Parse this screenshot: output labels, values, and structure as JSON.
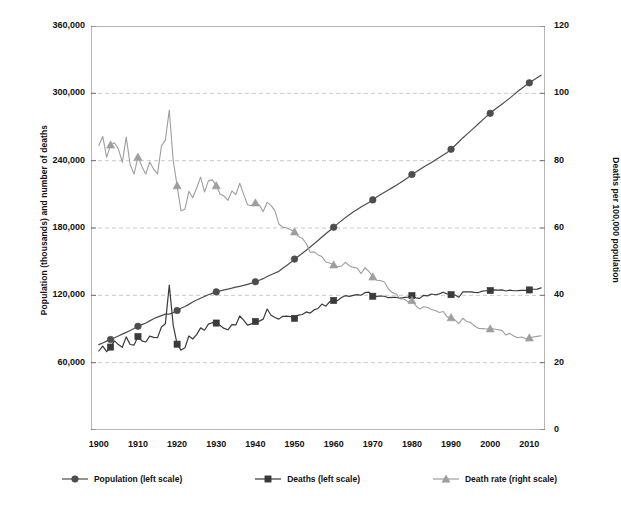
{
  "chart_data": {
    "type": "line",
    "title": "",
    "subtitle": "",
    "xlabel": "",
    "ylabel": "Population (thousands) and number of deaths",
    "y2label": "Deaths per 100,000 population",
    "xlim": [
      1898,
      2014
    ],
    "ylim": [
      0,
      360000
    ],
    "y2lim": [
      0,
      120
    ],
    "grid": true,
    "legend_position": "bottom",
    "x_ticks": [
      1900,
      1910,
      1920,
      1930,
      1940,
      1950,
      1960,
      1970,
      1980,
      1990,
      2000,
      2010
    ],
    "y_ticks": [
      0,
      60000,
      120000,
      180000,
      240000,
      300000,
      360000
    ],
    "y_tick_labels": [
      "",
      "60,000",
      "120,000",
      "180,000",
      "240,000",
      "300,000",
      "360,000"
    ],
    "y2_ticks": [
      0,
      20,
      40,
      60,
      80,
      100,
      120
    ],
    "y2_tick_labels": [
      "0",
      "20",
      "40",
      "60",
      "80",
      "100",
      "120"
    ],
    "marker_years": [
      1903,
      1910,
      1920,
      1930,
      1940,
      1950,
      1960,
      1970,
      1980,
      1990,
      2000,
      2010
    ],
    "series": [
      {
        "name": "Population (left scale)",
        "axis": "left",
        "color": "#4d4d4d",
        "marker": "circle",
        "x": [
          1900,
          1901,
          1902,
          1903,
          1904,
          1905,
          1906,
          1907,
          1908,
          1909,
          1910,
          1911,
          1912,
          1913,
          1914,
          1915,
          1916,
          1917,
          1918,
          1919,
          1920,
          1921,
          1922,
          1923,
          1924,
          1925,
          1926,
          1927,
          1928,
          1929,
          1930,
          1931,
          1932,
          1933,
          1934,
          1935,
          1936,
          1937,
          1938,
          1939,
          1940,
          1941,
          1942,
          1943,
          1944,
          1945,
          1946,
          1947,
          1948,
          1949,
          1950,
          1951,
          1952,
          1953,
          1954,
          1955,
          1956,
          1957,
          1958,
          1959,
          1960,
          1961,
          1962,
          1963,
          1964,
          1965,
          1966,
          1967,
          1968,
          1969,
          1970,
          1971,
          1972,
          1973,
          1974,
          1975,
          1976,
          1977,
          1978,
          1979,
          1980,
          1981,
          1982,
          1983,
          1984,
          1985,
          1986,
          1987,
          1988,
          1989,
          1990,
          1991,
          1992,
          1993,
          1994,
          1995,
          1996,
          1997,
          1998,
          1999,
          2000,
          2001,
          2002,
          2003,
          2004,
          2005,
          2006,
          2007,
          2008,
          2009,
          2010,
          2011,
          2012,
          2013
        ],
        "values": [
          76094,
          77585,
          79160,
          80632,
          82166,
          83822,
          85450,
          87008,
          88710,
          90490,
          92407,
          93863,
          95335,
          97225,
          99111,
          100546,
          101961,
          103268,
          103208,
          104514,
          106461,
          108538,
          110049,
          111947,
          114109,
          115829,
          117397,
          119035,
          120509,
          121767,
          123077,
          124040,
          124840,
          125579,
          126374,
          127250,
          128053,
          128825,
          129825,
          130880,
          132122,
          133402,
          134860,
          136739,
          138397,
          139928,
          141389,
          144126,
          146631,
          149188,
          152271,
          154878,
          157553,
          160184,
          163026,
          165931,
          168903,
          171984,
          174882,
          177830,
          180671,
          183691,
          186538,
          189242,
          191889,
          194303,
          196560,
          198712,
          200706,
          202677,
          205052,
          207661,
          209896,
          211909,
          213854,
          215973,
          218035,
          220239,
          222585,
          225055,
          227726,
          229966,
          232188,
          234307,
          236348,
          238466,
          240651,
          242804,
          245021,
          247342,
          250132,
          253493,
          256894,
          260255,
          263436,
          266557,
          269667,
          272912,
          276115,
          279295,
          282172,
          285082,
          287804,
          290326,
          293046,
          295753,
          298593,
          301580,
          304375,
          307007,
          309330,
          311583,
          313874,
          316129
        ],
        "unit": "thousands"
      },
      {
        "name": "Deaths (left scale)",
        "axis": "left",
        "color": "#3a3a3a",
        "marker": "square",
        "x": [
          1900,
          1901,
          1902,
          1903,
          1904,
          1905,
          1906,
          1907,
          1908,
          1909,
          1910,
          1911,
          1912,
          1913,
          1914,
          1915,
          1916,
          1917,
          1918,
          1919,
          1920,
          1921,
          1922,
          1923,
          1924,
          1925,
          1926,
          1927,
          1928,
          1929,
          1930,
          1931,
          1932,
          1933,
          1934,
          1935,
          1936,
          1937,
          1938,
          1939,
          1940,
          1941,
          1942,
          1943,
          1944,
          1945,
          1946,
          1947,
          1948,
          1949,
          1950,
          1951,
          1952,
          1953,
          1954,
          1955,
          1956,
          1957,
          1958,
          1959,
          1960,
          1961,
          1962,
          1963,
          1964,
          1965,
          1966,
          1967,
          1968,
          1969,
          1970,
          1971,
          1972,
          1973,
          1974,
          1975,
          1976,
          1977,
          1978,
          1979,
          1980,
          1981,
          1982,
          1983,
          1984,
          1985,
          1986,
          1987,
          1988,
          1989,
          1990,
          1991,
          1992,
          1993,
          1994,
          1995,
          1996,
          1997,
          1998,
          1999,
          2000,
          2001,
          2002,
          2003,
          2004,
          2005,
          2006,
          2007,
          2008,
          2009,
          2010,
          2011,
          2012,
          2013
        ],
        "values": [
          70400,
          74800,
          69800,
          73900,
          79400,
          76100,
          73700,
          83000,
          76200,
          75700,
          83300,
          79400,
          78400,
          83600,
          82500,
          82300,
          91800,
          94600,
          129200,
          93400,
          76500,
          71200,
          73200,
          83800,
          81100,
          85000,
          91000,
          88900,
          94300,
          95600,
          95300,
          93100,
          90500,
          89300,
          93900,
          93600,
          101600,
          97900,
          93500,
          94500,
          96700,
          97000,
          98800,
          107800,
          102300,
          100300,
          98800,
          101300,
          101400,
          101100,
          99500,
          102400,
          102900,
          105200,
          104200,
          107000,
          108300,
          112200,
          110300,
          114500,
          115400,
          115300,
          118000,
          119700,
          119100,
          119900,
          120700,
          120100,
          122400,
          122900,
          119200,
          119000,
          119400,
          119200,
          117900,
          118200,
          118100,
          117500,
          118100,
          118400,
          119800,
          117800,
          117300,
          120000,
          119500,
          121200,
          120500,
          121300,
          122800,
          121200,
          120600,
          120300,
          118300,
          123000,
          123200,
          123100,
          122600,
          122500,
          123700,
          124100,
          124300,
          124800,
          124700,
          124800,
          123900,
          124700,
          124100,
          124200,
          124500,
          124400,
          124800,
          125400,
          125600,
          126600
        ],
        "unit": "number of deaths"
      },
      {
        "name": "Death rate (right scale)",
        "axis": "right",
        "color": "#9e9e9e",
        "marker": "triangle",
        "x": [
          1900,
          1901,
          1902,
          1903,
          1904,
          1905,
          1906,
          1907,
          1908,
          1909,
          1910,
          1911,
          1912,
          1913,
          1914,
          1915,
          1916,
          1917,
          1918,
          1919,
          1920,
          1921,
          1922,
          1923,
          1924,
          1925,
          1926,
          1927,
          1928,
          1929,
          1930,
          1931,
          1932,
          1933,
          1934,
          1935,
          1936,
          1937,
          1938,
          1939,
          1940,
          1941,
          1942,
          1943,
          1944,
          1945,
          1946,
          1947,
          1948,
          1949,
          1950,
          1951,
          1952,
          1953,
          1954,
          1955,
          1956,
          1957,
          1958,
          1959,
          1960,
          1961,
          1962,
          1963,
          1964,
          1965,
          1966,
          1967,
          1968,
          1969,
          1970,
          1971,
          1972,
          1973,
          1974,
          1975,
          1976,
          1977,
          1978,
          1979,
          1980,
          1981,
          1982,
          1983,
          1984,
          1985,
          1986,
          1987,
          1988,
          1989,
          1990,
          1991,
          1992,
          1993,
          1994,
          1995,
          1996,
          1997,
          1998,
          1999,
          2000,
          2001,
          2002,
          2003,
          2004,
          2005,
          2006,
          2007,
          2008,
          2009,
          2010,
          2011,
          2012,
          2013
        ],
        "values": [
          84.5,
          87.2,
          81.0,
          84.7,
          85.3,
          83.5,
          79.5,
          87.0,
          78.8,
          76.0,
          81.1,
          78.3,
          76.0,
          79.6,
          77.5,
          76.1,
          84.4,
          86.1,
          95.0,
          80.1,
          72.6,
          65.1,
          65.6,
          70.9,
          69.0,
          71.9,
          75.1,
          70.7,
          74.0,
          74.3,
          72.6,
          70.0,
          69.5,
          68.2,
          71.0,
          69.9,
          73.3,
          70.0,
          66.9,
          66.6,
          67.5,
          66.8,
          64.9,
          67.6,
          66.7,
          65.1,
          61.2,
          60.2,
          60.0,
          59.5,
          58.9,
          57.5,
          56.9,
          55.4,
          52.8,
          52.9,
          52.0,
          51.5,
          49.9,
          49.6,
          49.1,
          48.5,
          48.7,
          49.8,
          48.8,
          48.3,
          48.1,
          46.5,
          48.2,
          47.1,
          45.5,
          44.5,
          44.4,
          43.9,
          41.9,
          40.8,
          40.4,
          38.9,
          38.9,
          38.1,
          38.5,
          36.9,
          35.9,
          36.6,
          36.4,
          35.8,
          35.5,
          34.9,
          35.2,
          33.6,
          33.4,
          32.7,
          31.6,
          33.2,
          32.2,
          31.9,
          30.9,
          30.2,
          30.1,
          30.0,
          30.1,
          30.0,
          29.8,
          29.6,
          28.2,
          28.7,
          27.9,
          27.4,
          27.6,
          27.2,
          27.4,
          27.6,
          27.8,
          28.0
        ],
        "unit": "deaths per 100,000 population"
      }
    ]
  },
  "legend": {
    "items": [
      {
        "label": "Population (left scale)",
        "marker": "circle",
        "color": "#4d4d4d"
      },
      {
        "label": "Deaths (left scale)",
        "marker": "square",
        "color": "#3a3a3a"
      },
      {
        "label": "Death rate (right scale)",
        "marker": "triangle",
        "color": "#9e9e9e"
      }
    ]
  },
  "axes": {
    "left_title": "Population (thousands) and number of deaths",
    "right_title": "Deaths per 100,000 population"
  }
}
